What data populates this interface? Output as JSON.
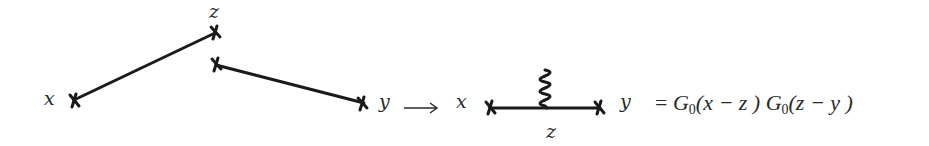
{
  "diagram": {
    "left": {
      "labels": {
        "x": "x",
        "z": "z",
        "y": "y"
      },
      "edges": [
        {
          "from": "x",
          "to": "z",
          "description": "propagator line from x to z"
        },
        {
          "from": "z",
          "to": "y",
          "description": "propagator line from z to y"
        }
      ]
    },
    "arrow": "⟶",
    "right": {
      "labels": {
        "x": "x",
        "y": "y",
        "z": "z"
      },
      "vertex": "z",
      "external_line": "wiggly (photon/potential) line attached at z"
    },
    "equation": {
      "equals": "=",
      "factor1": {
        "symbol": "G",
        "subscript": "0",
        "argument": "(x − z )"
      },
      "factor2": {
        "symbol": "G",
        "subscript": "0",
        "argument": "(z − y )"
      }
    },
    "colors": {
      "ink": "#1a1a1a",
      "background": "#ffffff"
    }
  }
}
